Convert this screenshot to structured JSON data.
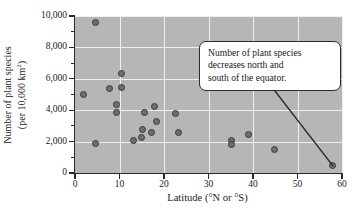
{
  "chart_data": {
    "type": "scatter",
    "title": "",
    "xlabel": "Latitude (°N or °S)",
    "ylabel_line1": "Number of plant species",
    "ylabel_line2_prefix": "(per 10,000 km",
    "ylabel_line2_sup": "2",
    "ylabel_line2_suffix": ")",
    "xlim": [
      0,
      60
    ],
    "ylim": [
      0,
      10000
    ],
    "xticks": [
      0,
      10,
      20,
      30,
      40,
      50,
      60
    ],
    "xtick_labels": [
      "0",
      "10",
      "20",
      "30",
      "40",
      "50",
      "60"
    ],
    "yticks": [
      0,
      2000,
      4000,
      6000,
      8000,
      10000
    ],
    "ytick_labels": [
      "0",
      "2,000",
      "4,000",
      "6,000",
      "8,000",
      "10,000"
    ],
    "yticks_minor": [
      1000,
      3000,
      5000,
      7000,
      9000
    ],
    "grid": "horizontal-and-vertical",
    "grid_color": "#efefef",
    "plot_background": "#b6b6b6",
    "marker_fill": "#6e6e6e",
    "marker_edge": "#3a3a3a",
    "legend": "none",
    "points": [
      {
        "x": 4.6,
        "y": 9600
      },
      {
        "x": 10.4,
        "y": 6350
      },
      {
        "x": 7.8,
        "y": 5400
      },
      {
        "x": 10.5,
        "y": 5450
      },
      {
        "x": 1.9,
        "y": 5000
      },
      {
        "x": 9.3,
        "y": 4350
      },
      {
        "x": 9.3,
        "y": 3850
      },
      {
        "x": 17.8,
        "y": 4250
      },
      {
        "x": 15.6,
        "y": 3850
      },
      {
        "x": 22.6,
        "y": 3800
      },
      {
        "x": 18.4,
        "y": 3250
      },
      {
        "x": 15.1,
        "y": 2750
      },
      {
        "x": 17.3,
        "y": 2550
      },
      {
        "x": 23.3,
        "y": 2600
      },
      {
        "x": 14.9,
        "y": 2250
      },
      {
        "x": 13.1,
        "y": 2100
      },
      {
        "x": 4.7,
        "y": 1900
      },
      {
        "x": 35.2,
        "y": 2100
      },
      {
        "x": 35.2,
        "y": 1830
      },
      {
        "x": 39.1,
        "y": 2450
      },
      {
        "x": 44.9,
        "y": 1500
      },
      {
        "x": 57.8,
        "y": 500
      }
    ],
    "annotations": [
      {
        "name": "callout",
        "lines": [
          "Number of plant species",
          "decreases north and",
          "south of the equator."
        ],
        "leader_from": {
          "x_px": 268,
          "y_px": 82
        },
        "leader_to": {
          "x_px": 333,
          "y_px": 166
        }
      }
    ]
  }
}
